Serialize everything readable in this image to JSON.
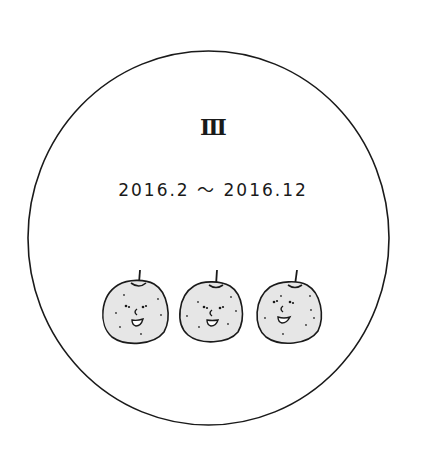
{
  "illustration": {
    "numeral": "Ⅲ",
    "date_range": "2016.2 〜 2016.12",
    "colors": {
      "background": "#ffffff",
      "line": "#1a1a1a",
      "pear_fill": "#e6e6e6"
    },
    "pears": [
      {
        "label": "pear-1",
        "cx": 135,
        "cy": 311,
        "rx": 33,
        "ry": 31
      },
      {
        "label": "pear-2",
        "cx": 210,
        "cy": 311,
        "rx": 32,
        "ry": 30
      },
      {
        "label": "pear-3",
        "cx": 289,
        "cy": 312,
        "rx": 33,
        "ry": 31
      }
    ]
  }
}
